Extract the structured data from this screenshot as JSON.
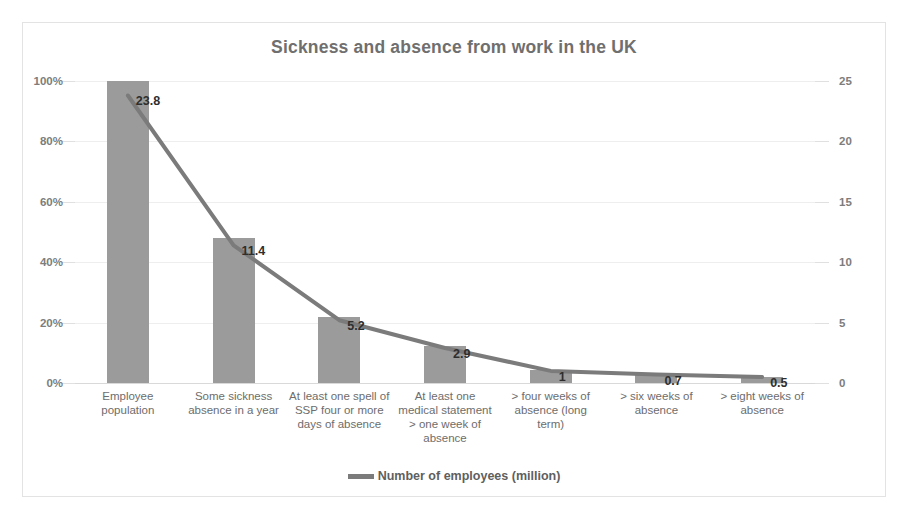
{
  "chart_data": {
    "type": "bar",
    "title": "Sickness and absence from work in the UK",
    "xlabel": "",
    "ylabel": "",
    "grid": true,
    "legend_position": "bottom",
    "categories": [
      "Employee population",
      "Some sickness absence in a year",
      "At least one spell of SSP four or more days of absence",
      "At least one medical statement > one week of absence",
      "> four weeks of absence (long term)",
      "> six weeks of absence",
      "> eight weeks of absence"
    ],
    "series": [
      {
        "name": "Percentage of employee population",
        "type": "bar",
        "axis": "left",
        "values": [
          100,
          47.9,
          21.8,
          12.2,
          4.2,
          2.9,
          2.1
        ],
        "color": "#9b9b9b"
      },
      {
        "name": "Number of employees (million)",
        "type": "line",
        "axis": "right",
        "values": [
          23.8,
          11.4,
          5.2,
          2.9,
          1,
          0.7,
          0.5
        ],
        "data_labels": [
          "23.8",
          "11.4",
          "5.2",
          "2.9",
          "1",
          "0.7",
          "0.5"
        ],
        "color": "#7b7b7b"
      }
    ],
    "left_axis": {
      "ticks": [
        "0%",
        "20%",
        "40%",
        "60%",
        "80%",
        "100%"
      ],
      "ylim": [
        0,
        100
      ]
    },
    "right_axis": {
      "ticks": [
        "0",
        "5",
        "10",
        "15",
        "20",
        "25"
      ],
      "ylim": [
        0,
        25
      ]
    },
    "legend": [
      {
        "label": "Number of employees (million)",
        "color": "#7b7b7b"
      }
    ]
  },
  "colors": {
    "bar": "#9b9b9b",
    "line": "#7b7b7b",
    "title_text": "#6f6f6f",
    "axis_text": "#7d7d7d",
    "category_text": "#6d6d6d",
    "gridline": "#eeeeee",
    "frame_border": "#e3e3e3",
    "background": "#ffffff"
  }
}
